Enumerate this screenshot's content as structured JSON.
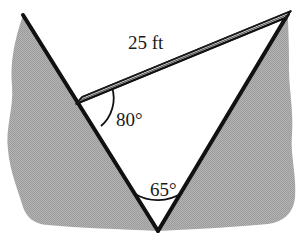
{
  "figure": {
    "background_color": "#ffffff",
    "ground_fill_color": "#a9a9a9",
    "ground_texture": "halftone-dither",
    "outline_color": "#111111",
    "plank_fill_color": "#f2f2f2",
    "plank_edge_color": "#1a1a1a",
    "open_area_color": "#ffffff"
  },
  "labels": {
    "plank_length": "25 ft",
    "angle_upper": "80°",
    "angle_vertex": "65°"
  },
  "geometry": {
    "left_peak": {
      "x": 23,
      "y": 15
    },
    "right_peak": {
      "x": 288,
      "y": 14
    },
    "bottom_vertex": {
      "x": 158,
      "y": 231
    },
    "plank_left_end": {
      "x": 77,
      "y": 101
    },
    "plank_right_end": {
      "x": 287,
      "y": 14
    },
    "plank_thickness": 7
  },
  "measurements": {
    "plank_length_value": 25,
    "plank_length_unit": "ft",
    "angle_upper_degrees": 80,
    "angle_vertex_degrees": 65
  }
}
